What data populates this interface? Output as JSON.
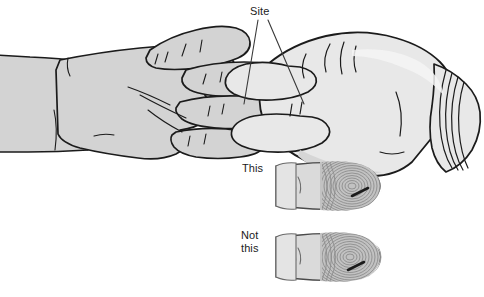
{
  "labels": {
    "site": "Site",
    "this": "This",
    "not_this": "Not\nthis"
  },
  "callout": {
    "name": "site-callout",
    "leader_lines": 2,
    "anchor_text": "Site"
  },
  "examples": [
    {
      "id": "correct",
      "label": "This",
      "caption_lines": [
        "This"
      ],
      "puncture_placement": "off-center, lateral side of fingerpad",
      "correct": true
    },
    {
      "id": "incorrect",
      "label": "Not this",
      "caption_lines": [
        "Not",
        "this"
      ],
      "puncture_placement": "center of fingerpad",
      "correct": false
    }
  ],
  "colors": {
    "background": "#ffffff",
    "outline": "#1b1b1b",
    "skin_fill": "#d3d3d3",
    "skin_shadow": "#bdbdbd",
    "glove_fill": "#e8e8e8",
    "glove_shadow": "#d6d6d6",
    "fingerprint_line": "#8a8a8a",
    "puncture_mark": "#1b1b1b",
    "label_text": "#1b1b1b",
    "leader_line": "#3a3a3a"
  },
  "geometry": {
    "canvas_width": 484,
    "canvas_height": 297
  }
}
